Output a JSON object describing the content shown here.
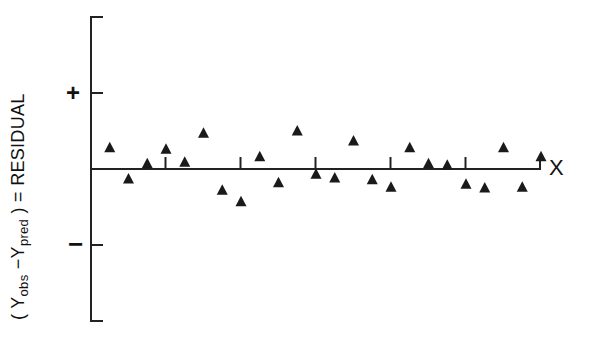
{
  "chart_data": {
    "type": "scatter",
    "title": "",
    "xlabel": "X",
    "ylabel": "(Yobs − Ypred) = RESIDUAL",
    "ylabel_parts": {
      "open": "( ",
      "y1": "Y",
      "sub1": "obs",
      "minus": " −",
      "y2": "Y",
      "sub2": "pred",
      "close": " ) = RESIDUAL"
    },
    "y_tick_labels": {
      "plus": "+",
      "minus": "−"
    },
    "ylim": [
      -2,
      2
    ],
    "x_ticks": [
      4,
      8,
      12,
      16,
      20
    ],
    "grid": false,
    "legend": null,
    "marker": "triangle",
    "color": "#1a1a1a",
    "series": [
      {
        "name": "residuals",
        "x": [
          1,
          2,
          3,
          4,
          5,
          6,
          7,
          8,
          9,
          10,
          11,
          12,
          13,
          14,
          15,
          16,
          17,
          18,
          19,
          20,
          21,
          22,
          23,
          24
        ],
        "values": [
          0.28,
          -0.13,
          0.07,
          0.26,
          0.09,
          0.47,
          -0.28,
          -0.43,
          0.16,
          -0.18,
          0.5,
          -0.07,
          -0.12,
          0.37,
          -0.14,
          -0.24,
          0.28,
          0.07,
          0.05,
          -0.2,
          -0.25,
          0.28,
          -0.24,
          0.16
        ]
      }
    ]
  }
}
